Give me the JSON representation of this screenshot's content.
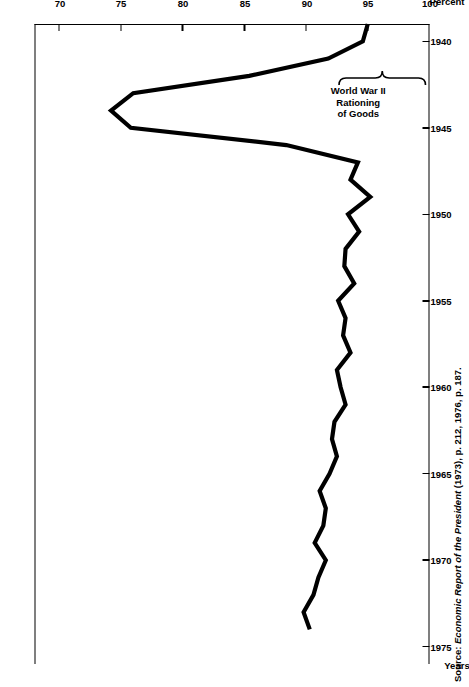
{
  "figure": {
    "source_prefix": "Source: ",
    "source_italic": "Economic Report of the President",
    "source_suffix": " (1973), p. 212, 1976, p. 187."
  },
  "annotation": {
    "line1": "World War II",
    "line2": "Rationing",
    "line3": "of Goods",
    "brace_from_year": 1941,
    "brace_to_year": 1946
  },
  "chart_data": {
    "type": "line",
    "title": "",
    "xlabel": "Years",
    "ylabel": "Percent",
    "xlim": [
      1939,
      1976
    ],
    "ylim": [
      68,
      100
    ],
    "y_inverted": true,
    "grid": false,
    "legend": "none",
    "xticks": [
      1940,
      1945,
      1950,
      1955,
      1960,
      1965,
      1970,
      1975
    ],
    "xtick_labels": [
      "1940",
      "1945",
      "1950",
      "1955",
      "1960",
      "1965",
      "1970",
      "1975"
    ],
    "yticks": [
      100,
      95,
      90,
      85,
      80,
      75,
      70
    ],
    "ytick_labels": [
      "100",
      "95",
      "90",
      "85",
      "80",
      "75",
      "70"
    ],
    "y_axis_top_label": "Percent",
    "y_axis_top_value": "100",
    "series": [
      {
        "name": "Personal consumption share",
        "x": [
          1939,
          1940,
          1941,
          1942,
          1943,
          1944,
          1945,
          1946,
          1947,
          1948,
          1949,
          1950,
          1951,
          1952,
          1953,
          1954,
          1955,
          1956,
          1957,
          1958,
          1959,
          1960,
          1961,
          1962,
          1963,
          1964,
          1965,
          1966,
          1967,
          1968,
          1969,
          1970,
          1971,
          1972,
          1973,
          1974
        ],
        "values": [
          95.0,
          94.6,
          91.8,
          85.4,
          76.0,
          74.2,
          75.8,
          88.4,
          94.2,
          93.6,
          95.2,
          93.4,
          94.3,
          93.2,
          93.1,
          93.9,
          92.6,
          93.2,
          93.0,
          93.6,
          92.5,
          92.8,
          93.2,
          92.3,
          92.1,
          92.5,
          91.9,
          91.1,
          91.6,
          91.4,
          90.7,
          91.6,
          91.0,
          90.6,
          89.8,
          90.3
        ]
      }
    ]
  }
}
